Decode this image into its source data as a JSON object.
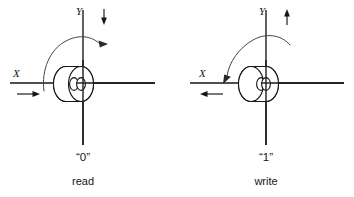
{
  "figure": {
    "type": "technical-diagram",
    "panel_count": 2
  },
  "panels": [
    {
      "id": "read",
      "state_label": "“0”",
      "operation_label": "read",
      "x_axis": {
        "label": "X",
        "current_direction": "right",
        "arrow_glyph": "→"
      },
      "y_axis": {
        "label": "Y",
        "current_direction": "down",
        "arrow_glyph": "↓"
      },
      "flux": {
        "direction": "clockwise",
        "arrow_position": "upper-right",
        "arrow_glyph": "→"
      },
      "core": {
        "name": "ferrite-toroid",
        "orientation": "front-face-right"
      }
    },
    {
      "id": "write",
      "state_label": "“1”",
      "operation_label": "write",
      "x_axis": {
        "label": "X",
        "current_direction": "left",
        "arrow_glyph": "←"
      },
      "y_axis": {
        "label": "Y",
        "current_direction": "up",
        "arrow_glyph": "↑"
      },
      "flux": {
        "direction": "counter-clockwise",
        "arrow_position": "upper-left",
        "arrow_glyph": "↙"
      },
      "core": {
        "name": "ferrite-toroid",
        "orientation": "front-face-left"
      }
    }
  ],
  "colors": {
    "ink": "#151515",
    "flux_ink": "#3a3a3a",
    "background": "#ffffff"
  }
}
